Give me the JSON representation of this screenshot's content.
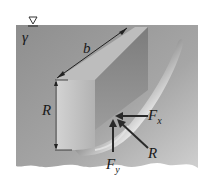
{
  "diagram": {
    "colors": {
      "fluid": "#9a9a9a",
      "fluid_light": "#c8c8c8",
      "gate_dark": "#6e6e6e",
      "gate_light": "#e8e8e8",
      "arrow": "#2a2a2a",
      "ground": "#ffffff"
    },
    "labels": {
      "free_surface_symbol": "∇",
      "specific_weight": "γ",
      "width": "b",
      "radius_dim": "R",
      "force_x": "F",
      "force_x_sub": "x",
      "force_y": "F",
      "force_y_sub": "y",
      "resultant": "R"
    }
  }
}
